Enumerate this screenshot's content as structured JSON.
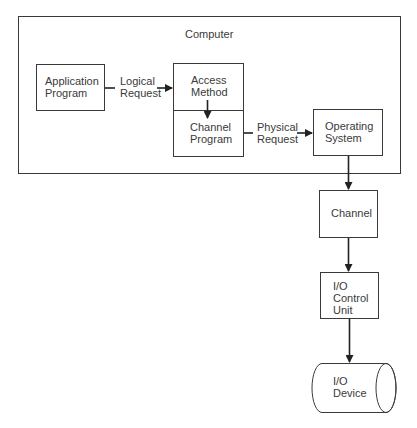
{
  "diagram": {
    "container": {
      "label": "Computer"
    },
    "nodes": {
      "application_program": "Application\nProgram",
      "access_method": "Access\nMethod",
      "channel_program": "Channel\nProgram",
      "operating_system": "Operating\nSystem",
      "channel": "Channel",
      "io_control_unit": "I/O\nControl\nUnit",
      "io_device": "I/O\nDevice"
    },
    "edges": {
      "logical_request": "Logical\nRequest",
      "physical_request": "Physical\nRequest"
    },
    "colors": {
      "stroke": "#3a3a3a",
      "background": "#ffffff"
    }
  }
}
